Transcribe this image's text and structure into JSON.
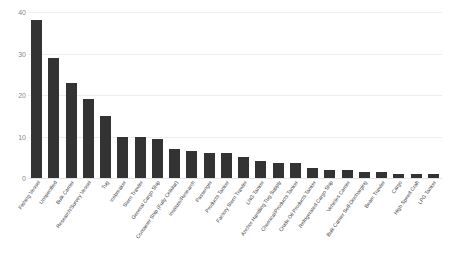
{
  "chart_data": {
    "type": "bar",
    "title": "",
    "xlabel": "",
    "ylabel": "",
    "ylim": [
      0,
      40
    ],
    "yticks": [
      0,
      10,
      20,
      30,
      40
    ],
    "grid": true,
    "legend": false,
    "bar_color": "#333333",
    "gridline_color": "#eeeeee",
    "tick_label_color": "#8a8a8a",
    "categories": [
      "Fishing Vessel",
      "Unspecified",
      "Bulk Carrier",
      "Research/Survey Vessel",
      "Tug",
      "Icebreaker",
      "Stern Trawler",
      "General Cargo Ship",
      "Container Ship (Fully Cellular)",
      "Institute/Research",
      "Passenger",
      "Products Tanker",
      "Factory Stern Trawler",
      "LNG Tanker",
      "Anchor Handling Tug Supply",
      "Chemical/Products Tanker",
      "Crude Oil Products Tanker",
      "Refrigerated Cargo Ship",
      "Vehicles Carrier",
      "Bulk Carrier Self-Discharging",
      "Beam Trawler",
      "Cargo",
      "High Speed Craft",
      "LPG Tanker"
    ],
    "values": [
      38,
      29,
      23,
      19,
      15,
      10,
      10,
      9.5,
      7,
      6.5,
      6,
      6,
      5,
      4,
      3.5,
      3.5,
      2.5,
      2,
      2,
      1.5,
      1.5,
      1,
      1,
      1
    ]
  },
  "caption": {
    "text": ""
  }
}
